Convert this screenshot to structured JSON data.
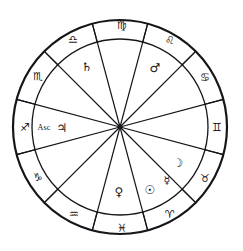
{
  "chart": {
    "type": "natal-wheel",
    "geometry": {
      "center_x": 120,
      "center_y": 127,
      "outer_radius": 107,
      "inner_radius": 88,
      "spoke_count": 12,
      "rotation_offset_deg": -75
    },
    "colors": {
      "stroke": "#15151a",
      "background": "#ffffff",
      "glyph": "#15151a"
    },
    "signs": [
      {
        "name": "virgo",
        "glyph": "♍",
        "label": "Virgo",
        "x": 122,
        "y": 25,
        "size": 11
      },
      {
        "name": "libra",
        "glyph": "♎",
        "label": "Libra",
        "x": 73,
        "y": 39,
        "size": 11
      },
      {
        "name": "scorpio",
        "glyph": "♏",
        "label": "Scorpio",
        "x": 38,
        "y": 76,
        "size": 11
      },
      {
        "name": "sagittarius",
        "glyph": "♐",
        "label": "Sagittarius",
        "x": 25,
        "y": 127,
        "size": 11
      },
      {
        "name": "capricorn",
        "glyph": "♑",
        "label": "Capricorn",
        "x": 38,
        "y": 177,
        "size": 11
      },
      {
        "name": "aquarius",
        "glyph": "♒",
        "label": "Aquarius",
        "x": 74,
        "y": 214,
        "size": 11
      },
      {
        "name": "pisces",
        "glyph": "♓",
        "label": "Pisces",
        "x": 122,
        "y": 228,
        "size": 11
      },
      {
        "name": "aries",
        "glyph": "♈",
        "label": "Aries",
        "x": 170,
        "y": 214,
        "size": 11
      },
      {
        "name": "taurus",
        "glyph": "♉",
        "label": "Taurus",
        "x": 205,
        "y": 178,
        "size": 11
      },
      {
        "name": "gemini",
        "glyph": "♊",
        "label": "Gemini",
        "x": 217,
        "y": 127,
        "size": 11
      },
      {
        "name": "cancer",
        "glyph": "♋",
        "label": "Cancer",
        "x": 205,
        "y": 77,
        "size": 11
      },
      {
        "name": "leo",
        "glyph": "♌",
        "label": "Leo",
        "x": 170,
        "y": 40,
        "size": 11
      }
    ],
    "planets": [
      {
        "name": "saturn",
        "glyph": "♄",
        "label": "Saturn",
        "x": 87,
        "y": 67,
        "size": 12
      },
      {
        "name": "mars",
        "glyph": "♂",
        "label": "Mars",
        "x": 155,
        "y": 68,
        "size": 12
      },
      {
        "name": "moon",
        "glyph": "☽",
        "label": "Moon",
        "x": 178,
        "y": 163,
        "size": 12
      },
      {
        "name": "mercury-inner",
        "glyph": "☿",
        "label": "Mercury",
        "x": 167,
        "y": 180,
        "size": 11
      },
      {
        "name": "sun",
        "glyph": "☉",
        "label": "Sun",
        "x": 150,
        "y": 190,
        "size": 12
      },
      {
        "name": "venus",
        "glyph": "♀",
        "label": "Venus",
        "x": 119,
        "y": 192,
        "size": 12
      },
      {
        "name": "jupiter",
        "glyph": "♃",
        "label": "Jupiter",
        "x": 62,
        "y": 128,
        "size": 12
      }
    ],
    "labels": [
      {
        "name": "ascendant-label",
        "text": "Asc",
        "x": 44,
        "y": 128,
        "size": 8
      }
    ]
  },
  "chart_data": {
    "type": "pie",
    "subtitle": "Twelve-house zodiac wheel with planetary placements",
    "categories": [
      "Virgo",
      "Libra",
      "Scorpio",
      "Sagittarius",
      "Capricorn",
      "Aquarius",
      "Pisces",
      "Aries",
      "Taurus",
      "Gemini",
      "Cancer",
      "Leo"
    ],
    "values": [
      30,
      30,
      30,
      30,
      30,
      30,
      30,
      30,
      30,
      30,
      30,
      30
    ],
    "unit": "degrees",
    "direction": "counterclockwise",
    "legend_position": "none",
    "grid": false,
    "annotations": [
      {
        "house_sign": "Libra",
        "content": "Saturn ♄"
      },
      {
        "house_sign": "Leo",
        "content": "Mars ♂"
      },
      {
        "house_sign": "Taurus",
        "content": "Moon ☽"
      },
      {
        "house_sign": "Aries",
        "content": "Mercury ☿"
      },
      {
        "house_sign": "Aries",
        "content": "Sun ☉"
      },
      {
        "house_sign": "Pisces",
        "content": "Venus ♀"
      },
      {
        "house_sign": "Sagittarius",
        "content": "Ascendant (Asc) and Jupiter ♃"
      }
    ]
  }
}
